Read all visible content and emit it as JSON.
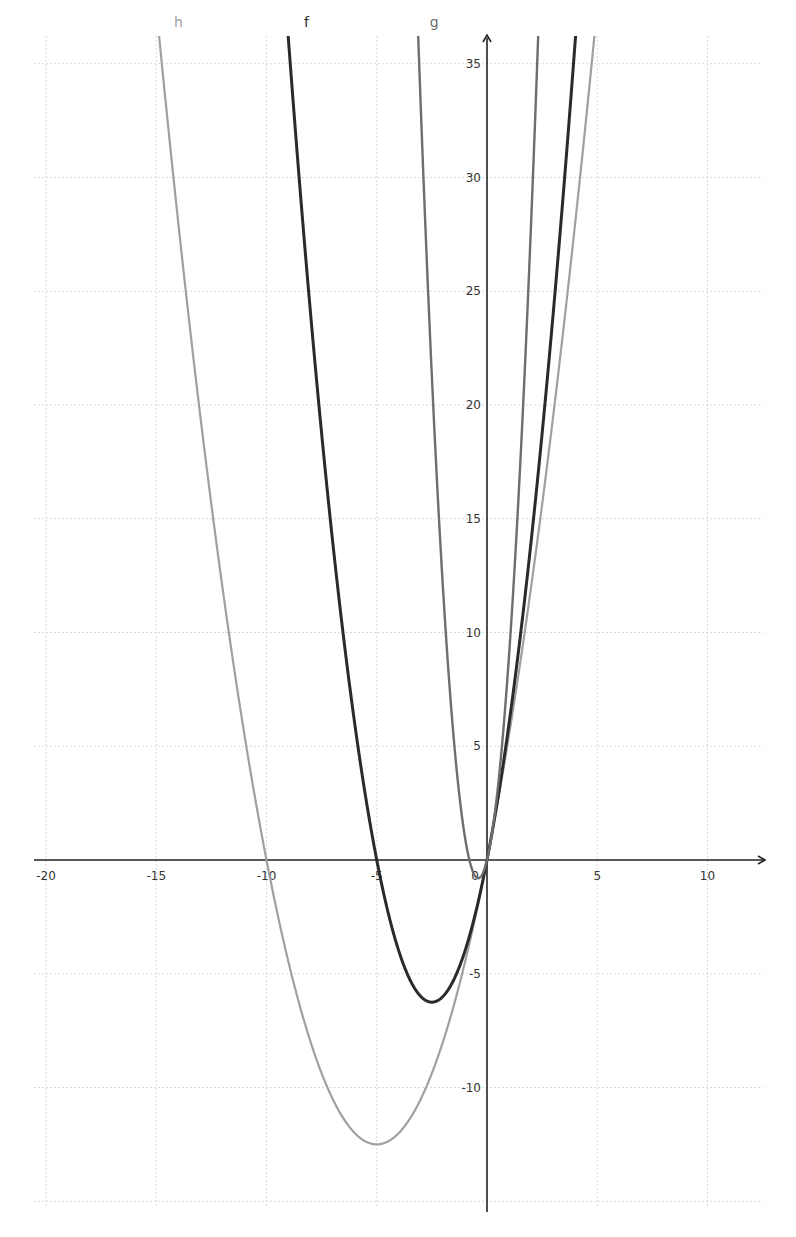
{
  "chart_data": {
    "type": "line",
    "title": "",
    "xlabel": "",
    "ylabel": "",
    "xlim": [
      -20.5,
      12.3
    ],
    "ylim": [
      -16,
      36.6
    ],
    "grid": true,
    "x_ticks": [
      -20,
      -15,
      -10,
      -5,
      0,
      5,
      10
    ],
    "x_tick_labels": [
      "-20",
      "-15",
      "-10",
      "-5",
      "0",
      "5",
      "10"
    ],
    "y_ticks": [
      -10,
      -5,
      5,
      10,
      15,
      20,
      25,
      30,
      35
    ],
    "y_tick_labels": [
      "-10",
      "-5",
      "5",
      "10",
      "15",
      "20",
      "25",
      "30",
      "35"
    ],
    "series": [
      {
        "name": "h",
        "expression": "0.5x^2 + 5x",
        "coefficients": [
          0.5,
          5,
          0
        ],
        "color": "#a0a0a0",
        "stroke_width": 2.2,
        "roots": [
          -10,
          0
        ],
        "vertex": [
          -5,
          -12.5
        ],
        "label_x": -14.2
      },
      {
        "name": "f",
        "expression": "x^2 + 5x",
        "coefficients": [
          1,
          5,
          0
        ],
        "color": "#2a2a2a",
        "stroke_width": 3,
        "roots": [
          -5,
          0
        ],
        "vertex": [
          -2.5,
          -6.25
        ],
        "label_x": -8.3
      },
      {
        "name": "g",
        "expression": "5x^2 + 4x",
        "coefficients": [
          5,
          4,
          0
        ],
        "color": "#6e6e6e",
        "stroke_width": 2.4,
        "roots": [
          -0.8,
          0
        ],
        "vertex": [
          -0.4,
          -0.8
        ],
        "label_x": -2.6
      }
    ],
    "legend_position": "inline-top"
  }
}
